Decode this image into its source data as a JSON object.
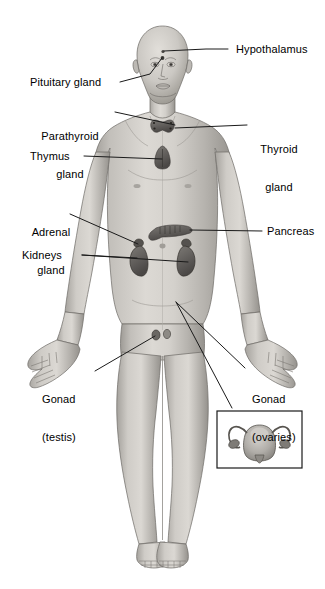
{
  "figure": {
    "background_color": "#ffffff",
    "line_color": "#1a1a1a",
    "text_color": "#000000",
    "body_fill_light": "#d8d6d2",
    "body_fill_mid": "#b4b1ac",
    "body_fill_dark": "#8d8a85",
    "organ_fill": "#6e6b67",
    "organ_dark": "#4a4745"
  },
  "labels": [
    {
      "id": "hypothalamus",
      "text": "Hypothalamus"
    },
    {
      "id": "pituitary-gland",
      "text": "Pituitary gland"
    },
    {
      "id": "parathyroid-gland",
      "line1": "Parathyroid",
      "line2": "gland"
    },
    {
      "id": "thyroid-gland",
      "line1": "Thyroid",
      "line2": "gland"
    },
    {
      "id": "thymus",
      "text": "Thymus"
    },
    {
      "id": "adrenal-gland",
      "line1": "Adrenal",
      "line2": "gland"
    },
    {
      "id": "pancreas",
      "text": "Pancreas"
    },
    {
      "id": "kidneys",
      "text": "Kidneys"
    },
    {
      "id": "gonad-testis",
      "line1": "Gonad",
      "line2": "(testis)"
    },
    {
      "id": "gonad-ovaries",
      "line1": "Gonad",
      "line2": "(ovaries)"
    }
  ],
  "inset": {
    "id": "uterus-ovaries-inset",
    "description": "Uterus with fallopian tubes and ovaries"
  }
}
